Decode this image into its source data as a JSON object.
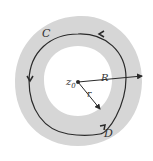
{
  "diagram": {
    "labels": {
      "curve_c": "C",
      "curve_d": "D",
      "center": "z",
      "center_sub": "0",
      "outer_radius": "R",
      "inner_radius": "r"
    },
    "colors": {
      "annulus": "#d6d6d6",
      "curve": "#2a2a2a",
      "background": "#ffffff"
    }
  }
}
